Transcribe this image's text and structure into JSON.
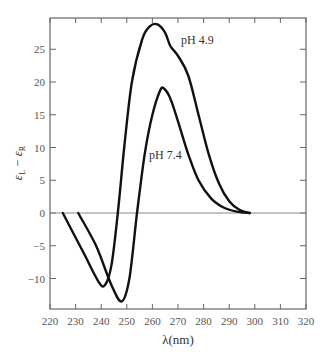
{
  "chart_data": {
    "type": "line",
    "title": "",
    "xlabel": "λ(nm)",
    "ylabel": "εL − εR",
    "xlim": [
      220,
      320
    ],
    "ylim": [
      -14.5,
      29.5
    ],
    "x_ticks": [
      220,
      230,
      240,
      250,
      260,
      270,
      280,
      290,
      300,
      310,
      320
    ],
    "y_ticks": [
      -10,
      -5,
      0,
      5,
      10,
      15,
      20,
      25
    ],
    "y_tick_labels": [
      "−10",
      "−5",
      "0",
      "5",
      "10",
      "15",
      "20",
      "25"
    ],
    "grid": false,
    "zero_line": true,
    "legend": "inline annotations",
    "series": [
      {
        "name": "pH 4.9",
        "x": [
          225,
          233,
          239,
          241.5,
          244,
          246.5,
          249,
          252,
          256,
          259,
          262,
          265,
          267,
          270,
          274,
          278,
          282,
          286,
          290,
          294,
          298
        ],
        "y": [
          0,
          -6,
          -10.5,
          -11,
          -8,
          0,
          10,
          20,
          26.5,
          28.5,
          28.8,
          27.5,
          25.5,
          24,
          21,
          15,
          9,
          4.5,
          1.8,
          0.5,
          0
        ]
      },
      {
        "name": "pH 7.4",
        "x": [
          231,
          238,
          244,
          248,
          251,
          254,
          257,
          260,
          263,
          264.5,
          267,
          270,
          274,
          278,
          283,
          288,
          293,
          298
        ],
        "y": [
          0,
          -5,
          -11,
          -13.5,
          -10,
          0,
          9,
          15,
          18.7,
          19,
          17.5,
          14,
          9,
          5,
          2.2,
          0.8,
          0.2,
          0
        ]
      }
    ],
    "annotations": [
      {
        "text": "pH 4.9",
        "x": 270,
        "y": 26
      },
      {
        "text": "pH 7.4",
        "x": 258,
        "y": 8.5
      }
    ]
  },
  "labels": {
    "xlabel": "λ(nm)",
    "ylabel_main": "ε",
    "ylabel_sub_l": "L",
    "ylabel_minus": "−",
    "ylabel_sub_r": "R",
    "annot_1": "pH 4.9",
    "annot_2": "pH 7.4"
  }
}
